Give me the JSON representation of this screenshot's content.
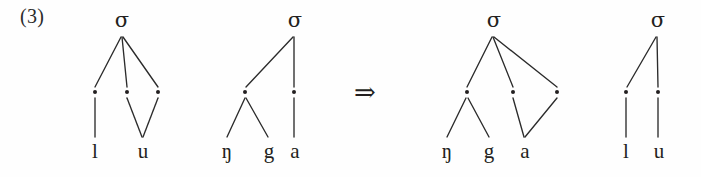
{
  "figure": {
    "example_number": "(3)",
    "operator": "⇒",
    "operator_name": "double-right-arrow",
    "ink_color": "#231f20",
    "background_color": "#fefefe"
  },
  "trees": [
    {
      "id": "tree-input-lu",
      "role": "input",
      "root_label": "σ",
      "moras": [
        "·",
        "·",
        "·"
      ],
      "terminals": [
        "l",
        "u"
      ],
      "description": "three moras, l linked to first mora, u linked to second and third moras"
    },
    {
      "id": "tree-input-nga",
      "role": "input",
      "root_label": "σ",
      "moras": [
        "·",
        "·"
      ],
      "terminals": [
        "ŋ",
        "g",
        "a"
      ],
      "description": "two moras, first mora dominates ŋ and g, second mora dominates a"
    },
    {
      "id": "tree-output-nga",
      "role": "output",
      "root_label": "σ",
      "moras": [
        "·",
        "·",
        "·"
      ],
      "terminals": [
        "ŋ",
        "g",
        "a"
      ],
      "description": "three moras, first mora dominates ŋ and g, a linked to second and third moras"
    },
    {
      "id": "tree-output-lu",
      "role": "output",
      "root_label": "σ",
      "moras": [
        "·",
        "·"
      ],
      "terminals": [
        "l",
        "u"
      ],
      "description": "two moras, each dominating one segment"
    }
  ]
}
